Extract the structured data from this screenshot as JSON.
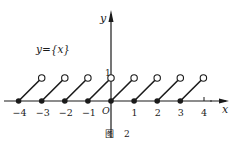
{
  "figure": {
    "function_label": "y={x}",
    "caption": "图 2",
    "caption_char": "图",
    "caption_num": "2",
    "axis_x_label": "x",
    "axis_y_label": "y",
    "origin_label": "O",
    "y_tick_label": "1",
    "colors": {
      "ink": "#1a1a1a",
      "background": "#ffffff"
    }
  },
  "chart_data": {
    "type": "line",
    "subtitle": "图 2",
    "xlabel": "x",
    "ylabel": "y",
    "xlim": [
      -4.5,
      5
    ],
    "ylim": [
      0,
      3.5
    ],
    "x_ticks": [
      -4,
      -3,
      -2,
      -1,
      0,
      1,
      2,
      3,
      4
    ],
    "x_tick_labels": [
      "−4",
      "−3",
      "−2",
      "−1",
      "O",
      "1",
      "2",
      "3",
      "4"
    ],
    "y_ticks": [
      1
    ],
    "y_tick_labels": [
      "1"
    ],
    "grid": false,
    "legend": null,
    "segments": [
      {
        "start": [
          -4,
          0
        ],
        "end": [
          -3,
          1
        ],
        "start_closed": true,
        "end_open": true
      },
      {
        "start": [
          -3,
          0
        ],
        "end": [
          -2,
          1
        ],
        "start_closed": true,
        "end_open": true
      },
      {
        "start": [
          -2,
          0
        ],
        "end": [
          -1,
          1
        ],
        "start_closed": true,
        "end_open": true
      },
      {
        "start": [
          -1,
          0
        ],
        "end": [
          0,
          1
        ],
        "start_closed": true,
        "end_open": true
      },
      {
        "start": [
          0,
          0
        ],
        "end": [
          1,
          1
        ],
        "start_closed": true,
        "end_open": true
      },
      {
        "start": [
          1,
          0
        ],
        "end": [
          2,
          1
        ],
        "start_closed": true,
        "end_open": true
      },
      {
        "start": [
          2,
          0
        ],
        "end": [
          3,
          1
        ],
        "start_closed": true,
        "end_open": true
      },
      {
        "start": [
          3,
          0
        ],
        "end": [
          4,
          1
        ],
        "start_closed": true,
        "end_open": true
      }
    ]
  }
}
